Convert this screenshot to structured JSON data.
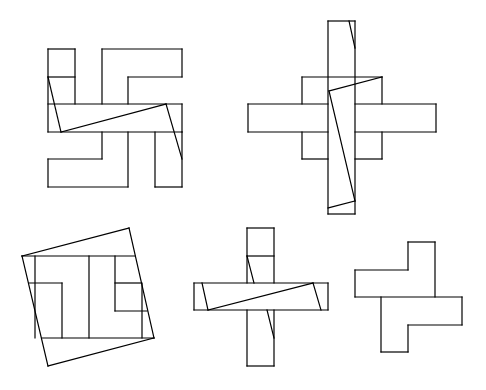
{
  "diagram": {
    "description": "Dissection puzzle: five line-drawn figures showing how a cross-shaped/hooked polyomino figure can be cut and rearranged",
    "canvas": {
      "width": 486,
      "height": 390,
      "background": "#ffffff",
      "stroke": "#000000"
    },
    "figures": [
      {
        "id": "figure-1",
        "label": "Hooked cross (swastika-like) figure with diagonal cuts",
        "lines": [
          [
            [
              48,
              49
            ],
            [
              75,
              49
            ]
          ],
          [
            [
              48,
              49
            ],
            [
              48,
              132
            ]
          ],
          [
            [
              75,
              49
            ],
            [
              75,
              104
            ]
          ],
          [
            [
              48,
              77
            ],
            [
              75,
              77
            ]
          ],
          [
            [
              102,
              49
            ],
            [
              182,
              49
            ]
          ],
          [
            [
              102,
              49
            ],
            [
              102,
              104
            ]
          ],
          [
            [
              182,
              49
            ],
            [
              182,
              77
            ]
          ],
          [
            [
              128,
              77
            ],
            [
              182,
              77
            ]
          ],
          [
            [
              128,
              77
            ],
            [
              128,
              104
            ]
          ],
          [
            [
              48,
              104
            ],
            [
              182,
              104
            ]
          ],
          [
            [
              48,
              132
            ],
            [
              182,
              132
            ]
          ],
          [
            [
              182,
              104
            ],
            [
              182,
              132
            ]
          ],
          [
            [
              48,
              77
            ],
            [
              61,
              132
            ]
          ],
          [
            [
              61,
              132
            ],
            [
              166,
              104
            ]
          ],
          [
            [
              166,
              104
            ],
            [
              182,
              159
            ]
          ],
          [
            [
              102,
              132
            ],
            [
              102,
              159
            ]
          ],
          [
            [
              48,
              159
            ],
            [
              102,
              159
            ]
          ],
          [
            [
              48,
              159
            ],
            [
              48,
              187
            ]
          ],
          [
            [
              48,
              187
            ],
            [
              128,
              187
            ]
          ],
          [
            [
              128,
              132
            ],
            [
              128,
              187
            ]
          ],
          [
            [
              155,
              132
            ],
            [
              155,
              187
            ]
          ],
          [
            [
              155,
              187
            ],
            [
              182,
              187
            ]
          ],
          [
            [
              182,
              132
            ],
            [
              182,
              187
            ]
          ]
        ]
      },
      {
        "id": "figure-2",
        "label": "Cross with long vertical bar and diagonal cuts",
        "lines": [
          [
            [
              328,
              21
            ],
            [
              355,
              21
            ]
          ],
          [
            [
              328,
              21
            ],
            [
              328,
              214
            ]
          ],
          [
            [
              355,
              21
            ],
            [
              355,
              214
            ]
          ],
          [
            [
              328,
              214
            ],
            [
              355,
              214
            ]
          ],
          [
            [
              349,
              21
            ],
            [
              355,
              48
            ]
          ],
          [
            [
              302,
              77
            ],
            [
              382,
              77
            ]
          ],
          [
            [
              302,
              77
            ],
            [
              302,
              104
            ]
          ],
          [
            [
              382,
              77
            ],
            [
              382,
              104
            ]
          ],
          [
            [
              248,
              104
            ],
            [
              328,
              104
            ]
          ],
          [
            [
              355,
              104
            ],
            [
              436,
              104
            ]
          ],
          [
            [
              248,
              104
            ],
            [
              248,
              132
            ]
          ],
          [
            [
              436,
              104
            ],
            [
              436,
              132
            ]
          ],
          [
            [
              248,
              132
            ],
            [
              328,
              132
            ]
          ],
          [
            [
              355,
              132
            ],
            [
              436,
              132
            ]
          ],
          [
            [
              302,
              132
            ],
            [
              302,
              159
            ]
          ],
          [
            [
              382,
              132
            ],
            [
              382,
              159
            ]
          ],
          [
            [
              302,
              159
            ],
            [
              328,
              159
            ]
          ],
          [
            [
              355,
              159
            ],
            [
              382,
              159
            ]
          ],
          [
            [
              382,
              77
            ],
            [
              329,
              91
            ]
          ],
          [
            [
              329,
              91
            ],
            [
              355,
              201
            ]
          ],
          [
            [
              355,
              201
            ],
            [
              328,
              208
            ]
          ]
        ]
      },
      {
        "id": "figure-3",
        "label": "Tilted square enclosing rearranged pieces",
        "lines": [
          [
            [
              22,
              256
            ],
            [
              129,
              228
            ]
          ],
          [
            [
              129,
              228
            ],
            [
              154,
              338
            ]
          ],
          [
            [
              154,
              338
            ],
            [
              48,
              366
            ]
          ],
          [
            [
              48,
              366
            ],
            [
              22,
              256
            ]
          ],
          [
            [
              22,
              256
            ],
            [
              135,
              256
            ]
          ],
          [
            [
              42,
              338
            ],
            [
              154,
              338
            ]
          ],
          [
            [
              35,
              256
            ],
            [
              35,
              338
            ]
          ],
          [
            [
              89,
              256
            ],
            [
              89,
              338
            ]
          ],
          [
            [
              29,
              283
            ],
            [
              62,
              283
            ]
          ],
          [
            [
              62,
              283
            ],
            [
              62,
              338
            ]
          ],
          [
            [
              115,
              256
            ],
            [
              115,
              311
            ]
          ],
          [
            [
              115,
              283
            ],
            [
              141,
              283
            ]
          ],
          [
            [
              115,
              311
            ],
            [
              147,
              311
            ]
          ],
          [
            [
              142,
              283
            ],
            [
              142,
              338
            ]
          ]
        ]
      },
      {
        "id": "figure-4",
        "label": "Plus shape with diagonal cuts",
        "lines": [
          [
            [
              247,
              228
            ],
            [
              274,
              228
            ]
          ],
          [
            [
              247,
              228
            ],
            [
              247,
              283
            ]
          ],
          [
            [
              274,
              228
            ],
            [
              274,
              283
            ]
          ],
          [
            [
              247,
              256
            ],
            [
              274,
              256
            ]
          ],
          [
            [
              194,
              283
            ],
            [
              328,
              283
            ]
          ],
          [
            [
              194,
              310
            ],
            [
              328,
              310
            ]
          ],
          [
            [
              194,
              283
            ],
            [
              194,
              310
            ]
          ],
          [
            [
              328,
              283
            ],
            [
              328,
              310
            ]
          ],
          [
            [
              247,
              310
            ],
            [
              247,
              366
            ]
          ],
          [
            [
              274,
              310
            ],
            [
              274,
              366
            ]
          ],
          [
            [
              247,
              366
            ],
            [
              274,
              366
            ]
          ],
          [
            [
              247,
              256
            ],
            [
              254,
              283
            ]
          ],
          [
            [
              202,
              283
            ],
            [
              208,
              310
            ]
          ],
          [
            [
              208,
              310
            ],
            [
              313,
              283
            ]
          ],
          [
            [
              313,
              283
            ],
            [
              321,
              310
            ]
          ],
          [
            [
              267,
              310
            ],
            [
              274,
              338
            ]
          ]
        ]
      },
      {
        "id": "figure-5",
        "label": "Two-piece interlocking T shape",
        "lines": [
          [
            [
              408,
              242
            ],
            [
              435,
              242
            ]
          ],
          [
            [
              435,
              242
            ],
            [
              435,
              297
            ]
          ],
          [
            [
              408,
              242
            ],
            [
              408,
              270
            ]
          ],
          [
            [
              355,
              270
            ],
            [
              408,
              270
            ]
          ],
          [
            [
              355,
              270
            ],
            [
              355,
              297
            ]
          ],
          [
            [
              355,
              297
            ],
            [
              462,
              297
            ]
          ],
          [
            [
              462,
              297
            ],
            [
              462,
              325
            ]
          ],
          [
            [
              408,
              325
            ],
            [
              462,
              325
            ]
          ],
          [
            [
              408,
              325
            ],
            [
              408,
              352
            ]
          ],
          [
            [
              381,
              352
            ],
            [
              408,
              352
            ]
          ],
          [
            [
              381,
              297
            ],
            [
              381,
              352
            ]
          ]
        ]
      }
    ]
  }
}
